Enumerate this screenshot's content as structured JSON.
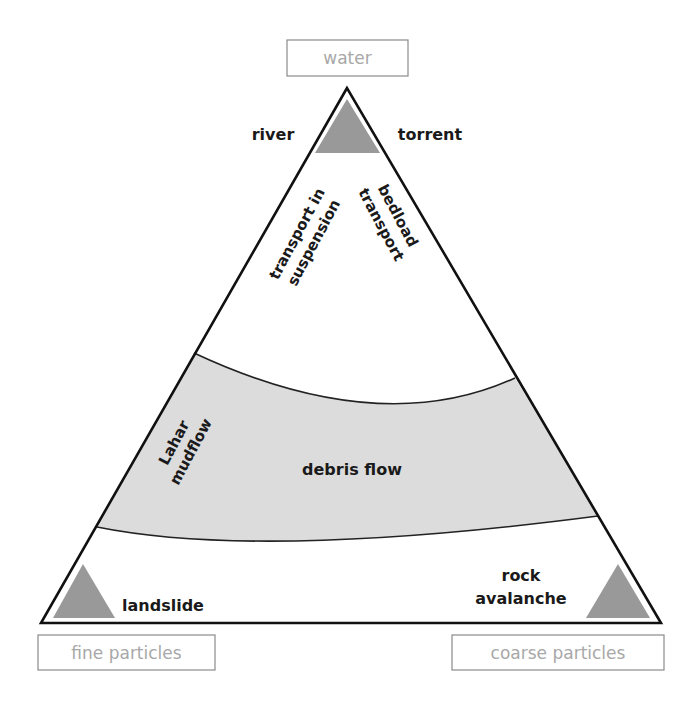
{
  "diagram": {
    "type": "ternary",
    "colors": {
      "outline": "#111111",
      "band_fill": "#dcdcdc",
      "marker_fill": "#999999",
      "box_border": "#8a8a8a",
      "box_text": "#a8a8a8",
      "label_text": "#1a1a1a"
    },
    "vertices": {
      "top": {
        "label": "water"
      },
      "bottom_left": {
        "label": "fine particles"
      },
      "bottom_right": {
        "label": "coarse particles"
      }
    },
    "labels": {
      "river": "river",
      "torrent": "torrent",
      "suspension_line1": "transport in",
      "suspension_line2": "suspension",
      "bedload_line1": "bedload",
      "bedload_line2": "transport",
      "lahar_line1": "Lahar",
      "lahar_line2": "mudflow",
      "debris_flow": "debris flow",
      "landslide": "landslide",
      "rock_line1": "rock",
      "rock_line2": "avalanche"
    },
    "regions": [
      {
        "name": "water transport",
        "labels": [
          "river",
          "torrent",
          "transport in suspension",
          "bedload transport"
        ]
      },
      {
        "name": "debris flow band",
        "labels": [
          "Lahar mudflow",
          "debris flow"
        ]
      },
      {
        "name": "mass movement",
        "labels": [
          "landslide",
          "rock avalanche"
        ]
      }
    ]
  }
}
